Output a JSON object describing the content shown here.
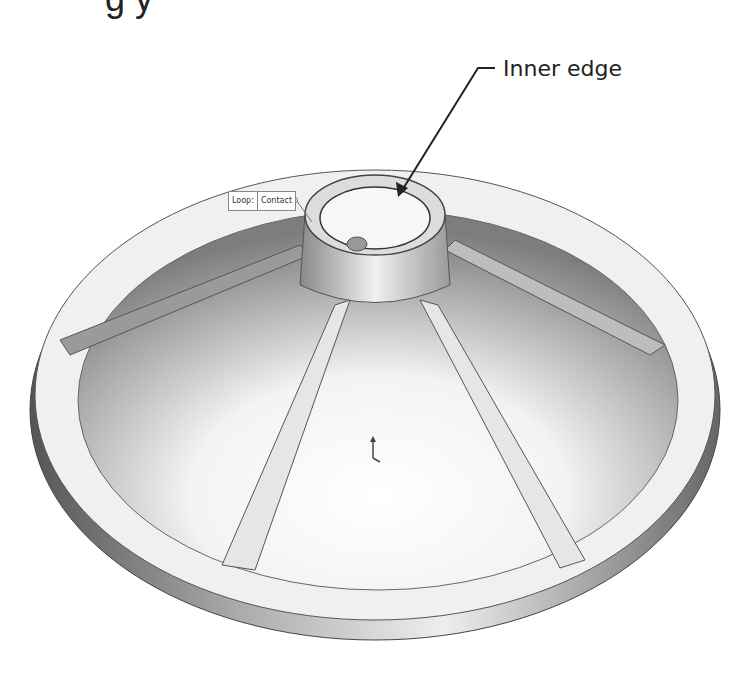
{
  "header": {
    "partial_title": "g                                y"
  },
  "callout": {
    "label": "Inner edge"
  },
  "selection_tag": {
    "key": "Loop:",
    "value": "Contact"
  },
  "colors": {
    "background": "#ffffff",
    "model_light": "#f4f4f4",
    "model_dark": "#7a7a7a",
    "line": "#222222"
  }
}
